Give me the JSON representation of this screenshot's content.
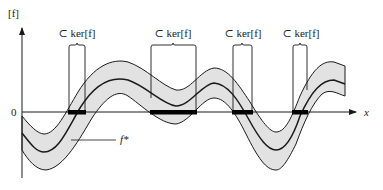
{
  "diagram": {
    "y_axis_label": "[f]",
    "x_axis_label": "x",
    "origin_label": "0",
    "curve_label": "f*",
    "kernel_label": "⊂ ker[f]",
    "kernel_intervals_count": 4,
    "colors": {
      "band_fill": "#e2e2e2",
      "stroke": "#1a1a1a",
      "kernel_bar": "#000000"
    }
  }
}
